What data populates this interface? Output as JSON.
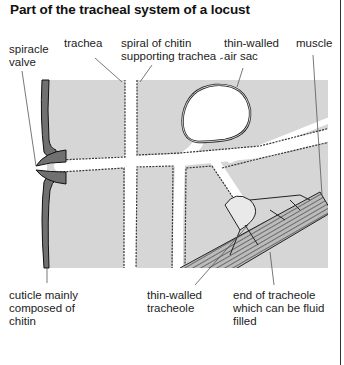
{
  "title": "Part of the tracheal system of a locust",
  "labels": {
    "spiracle_valve": "spiracle\nvalve",
    "trachea": "trachea",
    "spiral_of_chitin": "spiral of chitin\nsupporting trachea",
    "thin_walled_air_sac": "thin-walled\nair sac",
    "muscle": "muscle",
    "cuticle": "cuticle mainly\ncomposed of\nchitin",
    "thin_walled_tracheole": "thin-walled\ntracheole",
    "end_of_tracheole": "end of tracheole\nwhich can be fluid\nfilled"
  },
  "colors": {
    "tissue": "#d6d6d6",
    "cuticle": "#707070",
    "outline": "#222222",
    "background": "#ffffff"
  }
}
